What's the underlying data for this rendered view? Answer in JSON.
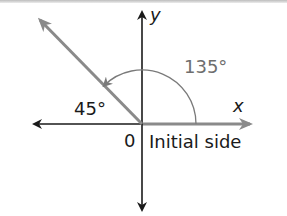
{
  "diagram": {
    "labels": {
      "y_axis": "y",
      "x_axis": "x",
      "angle_main": "135°",
      "angle_ref": "45°",
      "origin": "0",
      "initial_side": "Initial side"
    },
    "colors": {
      "axis": "#1a1a1a",
      "ray": "#8a8a8a",
      "arc": "#7a7a7a",
      "text_gray": "#6e6e6e",
      "text_dark": "#1a1a1a"
    },
    "angle_degrees": 135
  }
}
